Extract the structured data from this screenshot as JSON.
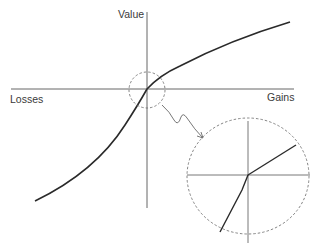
{
  "diagram": {
    "labels": {
      "y_axis": "Value",
      "x_negative": "Losses",
      "x_positive": "Gains"
    },
    "colors": {
      "curve": "#2a2a2a",
      "axis": "#555555",
      "dashed": "#666666",
      "text": "#3a3a3a",
      "background": "#ffffff"
    },
    "origin": [
      147,
      89
    ],
    "curve_gains_end": [
      290,
      22
    ],
    "curve_losses_end": [
      35,
      201
    ],
    "zoom_circle_small": {
      "center": [
        147,
        89
      ],
      "radius": 18
    },
    "zoom_circle_large": {
      "center": [
        248,
        176
      ],
      "rx": 61,
      "ry": 58
    },
    "callout_arrow": {
      "from": [
        162,
        104
      ],
      "to": [
        203,
        138
      ]
    }
  }
}
